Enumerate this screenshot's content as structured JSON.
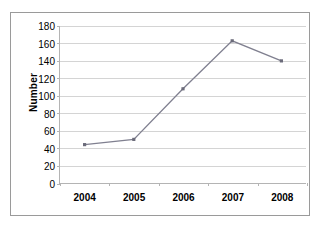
{
  "chart_data": {
    "type": "line",
    "title": "",
    "subtitle": "",
    "xlabel": "",
    "ylabel": "Number",
    "categories": [
      "2004",
      "2005",
      "2006",
      "2007",
      "2008"
    ],
    "values": [
      44,
      50,
      108,
      163,
      140
    ],
    "series": [
      {
        "name": "Number",
        "values": [
          44,
          50,
          108,
          163,
          140
        ]
      }
    ],
    "ylim": [
      0,
      180
    ],
    "ytick_step": 20,
    "yticks": [
      0,
      20,
      40,
      60,
      80,
      100,
      120,
      140,
      160,
      180
    ],
    "ytick_labels": [
      "0",
      "20",
      "40",
      "60",
      "80",
      "100",
      "120",
      "140",
      "160",
      "180"
    ],
    "xticks": [
      "2004",
      "2005",
      "2006",
      "2007",
      "2008"
    ],
    "grid": "horizontal",
    "legend": "none",
    "legend_position": "none",
    "annotations": [],
    "colors": {
      "line": "#808090",
      "marker": "#6b6b7a",
      "gridline": "#d4d4d4",
      "axis": "#b4b4b4",
      "frame": "#9a9a9a",
      "background": "#ffffff",
      "text": "#000000"
    },
    "marker_style": "square",
    "line_width": 1.3
  }
}
